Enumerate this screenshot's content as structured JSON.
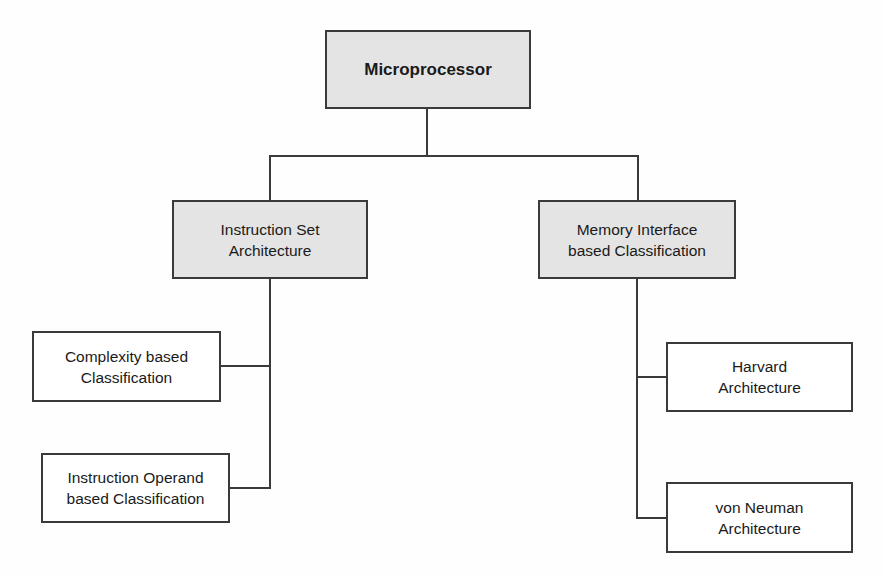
{
  "diagram": {
    "type": "tree",
    "root": {
      "id": "microprocessor",
      "label": "Microprocessor",
      "style": "shaded-bold"
    },
    "branches": [
      {
        "id": "isa",
        "label": "Instruction Set\nArchitecture",
        "style": "shaded",
        "children": [
          {
            "id": "complexity",
            "label": "Complexity based\nClassification"
          },
          {
            "id": "operand",
            "label": "Instruction Operand\nbased Classification"
          }
        ]
      },
      {
        "id": "memory",
        "label": "Memory Interface\nbased Classification",
        "style": "shaded",
        "children": [
          {
            "id": "harvard",
            "label": "Harvard\nArchitecture"
          },
          {
            "id": "vonneuman",
            "label": "von Neuman\nArchitecture"
          }
        ]
      }
    ],
    "edges": [
      [
        "microprocessor",
        "isa"
      ],
      [
        "microprocessor",
        "memory"
      ],
      [
        "isa",
        "complexity"
      ],
      [
        "isa",
        "operand"
      ],
      [
        "memory",
        "harvard"
      ],
      [
        "memory",
        "vonneuman"
      ]
    ],
    "colors": {
      "shaded_fill": "#e4e4e4",
      "plain_fill": "#ffffff",
      "stroke": "#3a3a3a",
      "text": "#1a1a1a"
    }
  }
}
